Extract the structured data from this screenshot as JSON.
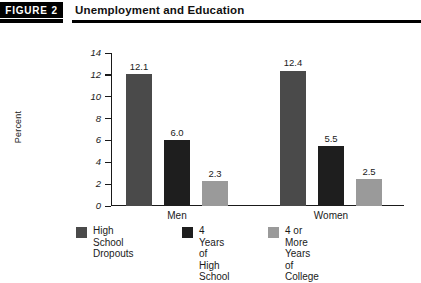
{
  "figure": {
    "tag": "FIGURE 2",
    "title": "Unemployment and Education"
  },
  "chart_data": {
    "type": "bar",
    "title": "Unemployment and Education",
    "xlabel": "",
    "ylabel": "Percent",
    "ylim": [
      0,
      14
    ],
    "yticks": [
      0,
      2,
      4,
      6,
      8,
      10,
      12,
      14
    ],
    "ytick_labels": [
      "0",
      "2",
      "4",
      "6",
      "8",
      "10",
      "12",
      "14"
    ],
    "grid": false,
    "legend_position": "bottom",
    "categories": [
      "Men",
      "Women"
    ],
    "series": [
      {
        "name": "High School Dropouts",
        "values": [
          12.1,
          12.4
        ],
        "value_labels": [
          "12.1",
          "12.4"
        ],
        "color": "#4a4a4a"
      },
      {
        "name": "4 Years of High School",
        "values": [
          6.0,
          5.5
        ],
        "value_labels": [
          "6.0",
          "5.5"
        ],
        "color": "#1e1e1e"
      },
      {
        "name": "4 or More Years of College",
        "values": [
          2.3,
          2.5
        ],
        "value_labels": [
          "2.3",
          "2.5"
        ],
        "color": "#9a9a9a"
      }
    ]
  },
  "legend": {
    "items": [
      {
        "label": "High School\nDropouts",
        "color": "#4a4a4a"
      },
      {
        "label": "4 Years of\nHigh School",
        "color": "#1e1e1e"
      },
      {
        "label": "4 or More Years\nof College",
        "color": "#9a9a9a"
      }
    ]
  }
}
